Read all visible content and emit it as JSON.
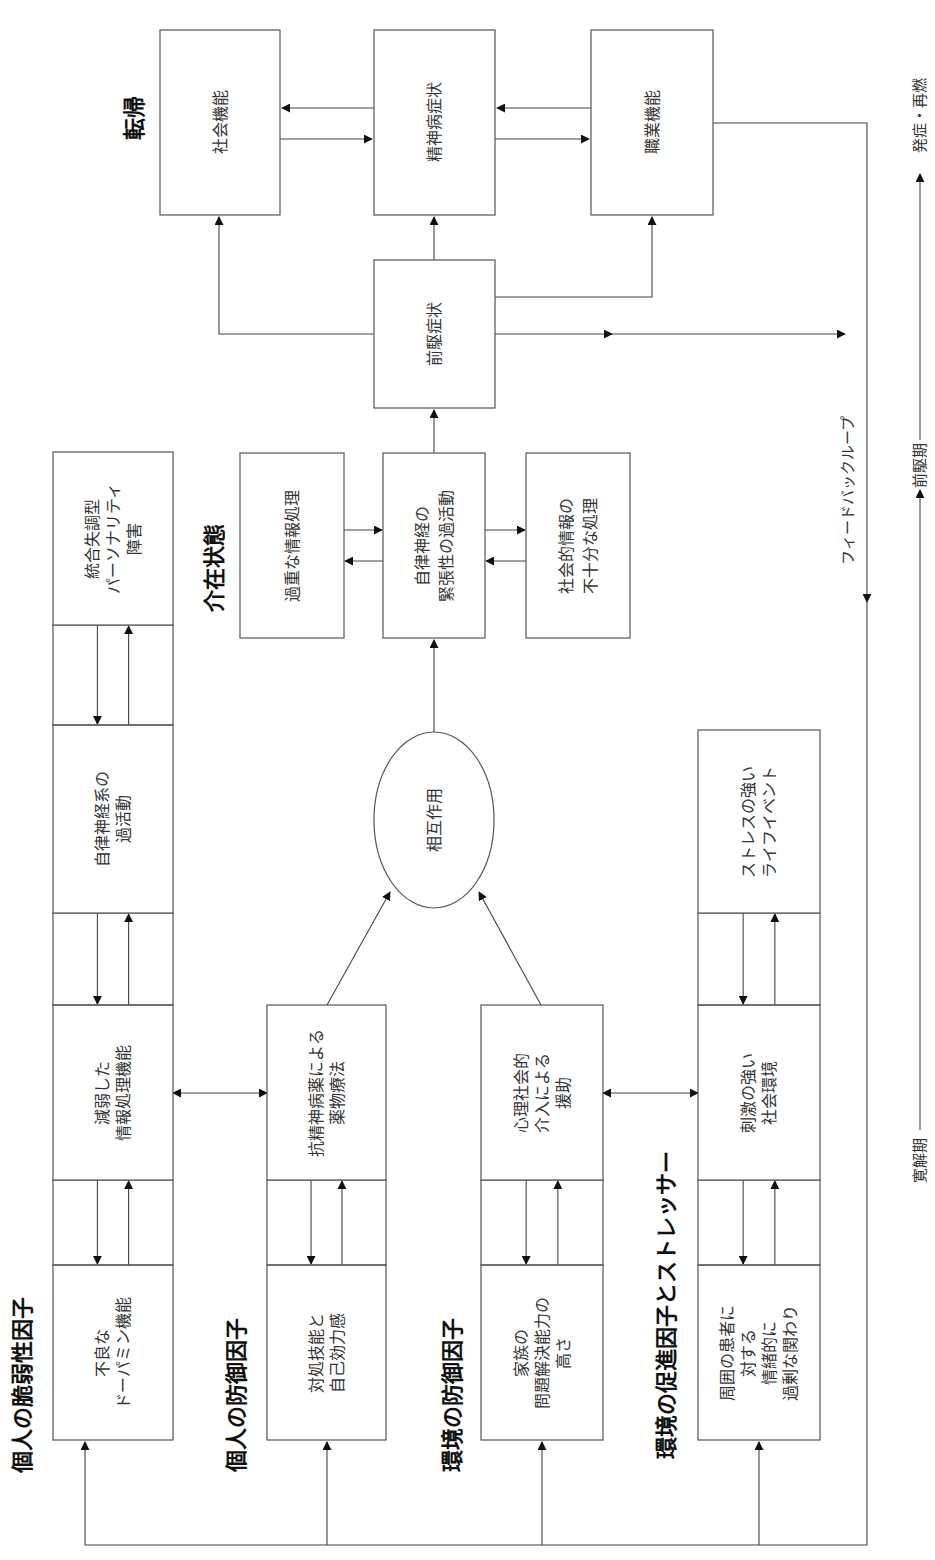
{
  "orientation": "rotated-90-ccw",
  "sections": {
    "vulnerability": {
      "title": "個人の脆弱性因子",
      "boxes": [
        [
          "不良な",
          "ドーパミン機能"
        ],
        [
          "減弱した",
          "情報処理機能"
        ],
        [
          "自律神経系の",
          "過活動"
        ],
        [
          "統合失調型",
          "パーソナリティ",
          "障害"
        ]
      ]
    },
    "personal_protective": {
      "title": "個人の防御因子",
      "boxes": [
        [
          "対処技能と",
          "自己効力感"
        ],
        [
          "抗精神病薬による",
          "薬物療法"
        ]
      ]
    },
    "environmental_protective": {
      "title": "環境の防御因子",
      "boxes": [
        [
          "家族の",
          "問題解決能力の",
          "高さ"
        ],
        [
          "心理社会的",
          "介入による",
          "援助"
        ]
      ]
    },
    "environmental_stressors": {
      "title": "環境の促進因子とストレッサー",
      "boxes": [
        [
          "周囲の患者に",
          "対する",
          "情緒的に",
          "過剰な関わり"
        ],
        [
          "刺激の強い",
          "社会環境"
        ],
        [
          "ストレスの強い",
          "ライフイベント"
        ]
      ]
    },
    "interaction": {
      "label": "相互作用"
    },
    "intermediate": {
      "title": "介在状態",
      "boxes": [
        [
          "過重な情報処理"
        ],
        [
          "自律神経の",
          "緊張性の過活動"
        ],
        [
          "社会的情報の",
          "不十分な処理"
        ]
      ]
    },
    "prodromal": {
      "label": "前駆症状"
    },
    "outcome": {
      "title": "転帰",
      "boxes": [
        [
          "社会機能"
        ],
        [
          "精神病症状"
        ],
        [
          "職業機能"
        ]
      ]
    }
  },
  "feedback_loop": {
    "label": "フィードバックループ"
  },
  "timeline": {
    "phases": [
      "寛解期",
      "前駆期",
      "発症・再燃"
    ]
  }
}
